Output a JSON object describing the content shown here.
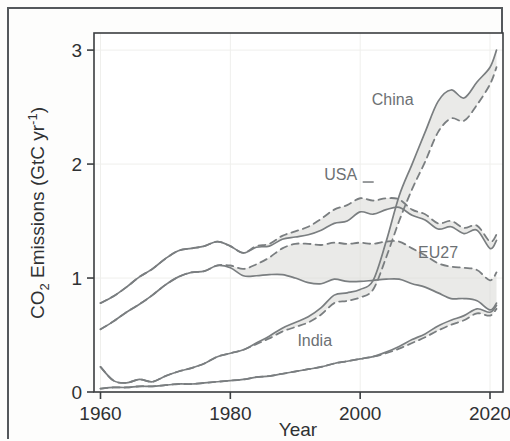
{
  "figure": {
    "kind": "scientific-line-chart",
    "background_color": "#fdfdfc",
    "frame_color": "#54585c"
  },
  "axes": {
    "y_title_main": "CO",
    "y_title_sub": "2",
    "y_title_rest": " Emissions (GtC yr",
    "y_title_sup": "-1",
    "y_title_close": ")",
    "y_title_full": "CO2 Emissions (GtC yr-1)",
    "x_title": "Year",
    "x_ticks": [
      "1960",
      "1980",
      "2000",
      "2020"
    ],
    "y_ticks": [
      "0",
      "1",
      "2",
      "3"
    ]
  },
  "series_labels": {
    "china": "China",
    "usa": "USA",
    "eu27": "EU27",
    "india": "India"
  },
  "colors": {
    "line": "#7a7e80",
    "line_dark": "#5f6366",
    "band_fill": "#d9d9d6",
    "grid": "#efefec",
    "axis": "#3b3e40",
    "label_text": "#6d7174"
  },
  "chart_data": {
    "type": "line",
    "title": "",
    "subtitle": "",
    "xlabel": "Year",
    "ylabel": "CO2 Emissions (GtC yr-1)",
    "xlim": [
      1959,
      2022
    ],
    "ylim": [
      0,
      3.15
    ],
    "xticks": [
      1960,
      1980,
      2000,
      2020
    ],
    "yticks": [
      0,
      1,
      2,
      3
    ],
    "grid": true,
    "grid_style": "faint major gridlines",
    "legend": "inline labels placed next to each curve",
    "annotations": [
      {
        "text": "China",
        "x": 2005,
        "y": 2.52
      },
      {
        "text": "USA",
        "x": 1997,
        "y": 1.86
      },
      {
        "text": "EU27",
        "x": 2012,
        "y": 1.18
      },
      {
        "text": "India",
        "x": 1993,
        "y": 0.4
      }
    ],
    "line_style_note": "each region drawn as a solid territorial-emissions line plus a dashed consumption-emissions line; grey shading fills the gap between them",
    "x": [
      1960,
      1962,
      1964,
      1966,
      1968,
      1970,
      1972,
      1974,
      1976,
      1978,
      1980,
      1982,
      1984,
      1986,
      1988,
      1990,
      1992,
      1994,
      1996,
      1998,
      2000,
      2002,
      2004,
      2006,
      2008,
      2010,
      2012,
      2014,
      2016,
      2018,
      2020,
      2021
    ],
    "series": [
      {
        "name": "China",
        "style": "solid",
        "values": [
          0.22,
          0.1,
          0.08,
          0.11,
          0.09,
          0.14,
          0.18,
          0.21,
          0.25,
          0.31,
          0.34,
          0.37,
          0.43,
          0.49,
          0.56,
          0.61,
          0.66,
          0.74,
          0.85,
          0.87,
          0.9,
          0.98,
          1.32,
          1.72,
          2.0,
          2.28,
          2.55,
          2.65,
          2.58,
          2.72,
          2.85,
          3.0
        ]
      },
      {
        "name": "China (dashed)",
        "style": "dashed",
        "values": [
          0.22,
          0.1,
          0.08,
          0.11,
          0.09,
          0.14,
          0.18,
          0.21,
          0.25,
          0.31,
          0.34,
          0.37,
          0.42,
          0.47,
          0.53,
          0.57,
          0.61,
          0.68,
          0.78,
          0.8,
          0.83,
          0.9,
          1.18,
          1.5,
          1.78,
          2.02,
          2.28,
          2.4,
          2.38,
          2.52,
          2.7,
          2.85
        ]
      },
      {
        "name": "USA",
        "style": "solid",
        "values": [
          0.78,
          0.84,
          0.92,
          1.01,
          1.08,
          1.17,
          1.24,
          1.26,
          1.28,
          1.32,
          1.28,
          1.22,
          1.27,
          1.28,
          1.34,
          1.36,
          1.38,
          1.42,
          1.48,
          1.5,
          1.58,
          1.56,
          1.6,
          1.62,
          1.55,
          1.51,
          1.43,
          1.45,
          1.39,
          1.42,
          1.26,
          1.33
        ]
      },
      {
        "name": "USA (dashed)",
        "style": "dashed",
        "values": [
          0.78,
          0.84,
          0.92,
          1.01,
          1.08,
          1.17,
          1.24,
          1.26,
          1.28,
          1.32,
          1.28,
          1.22,
          1.28,
          1.3,
          1.37,
          1.41,
          1.45,
          1.52,
          1.6,
          1.64,
          1.7,
          1.68,
          1.7,
          1.69,
          1.6,
          1.56,
          1.48,
          1.5,
          1.44,
          1.46,
          1.32,
          1.38
        ]
      },
      {
        "name": "EU27",
        "style": "solid",
        "values": [
          0.55,
          0.62,
          0.7,
          0.77,
          0.85,
          0.94,
          1.01,
          1.05,
          1.06,
          1.11,
          1.09,
          1.02,
          1.02,
          1.03,
          1.03,
          1.0,
          0.96,
          0.95,
          0.99,
          0.97,
          0.97,
          0.98,
          0.99,
          0.99,
          0.95,
          0.92,
          0.87,
          0.82,
          0.82,
          0.8,
          0.72,
          0.78
        ]
      },
      {
        "name": "EU27 (dashed)",
        "style": "dashed",
        "values": [
          0.55,
          0.62,
          0.7,
          0.77,
          0.85,
          0.94,
          1.01,
          1.05,
          1.06,
          1.11,
          1.11,
          1.08,
          1.12,
          1.18,
          1.26,
          1.3,
          1.3,
          1.29,
          1.31,
          1.3,
          1.31,
          1.3,
          1.32,
          1.32,
          1.26,
          1.2,
          1.13,
          1.1,
          1.09,
          1.07,
          0.98,
          1.05
        ]
      },
      {
        "name": "India",
        "style": "solid",
        "values": [
          0.03,
          0.04,
          0.04,
          0.05,
          0.05,
          0.06,
          0.07,
          0.07,
          0.08,
          0.09,
          0.1,
          0.11,
          0.13,
          0.14,
          0.16,
          0.18,
          0.2,
          0.22,
          0.25,
          0.27,
          0.29,
          0.31,
          0.35,
          0.4,
          0.46,
          0.51,
          0.58,
          0.63,
          0.67,
          0.73,
          0.7,
          0.76
        ]
      },
      {
        "name": "India (dashed)",
        "style": "dashed",
        "values": [
          0.03,
          0.04,
          0.04,
          0.05,
          0.05,
          0.06,
          0.07,
          0.07,
          0.08,
          0.09,
          0.1,
          0.11,
          0.13,
          0.14,
          0.16,
          0.18,
          0.2,
          0.22,
          0.25,
          0.27,
          0.29,
          0.31,
          0.34,
          0.38,
          0.43,
          0.48,
          0.54,
          0.59,
          0.63,
          0.69,
          0.67,
          0.73
        ]
      }
    ]
  }
}
